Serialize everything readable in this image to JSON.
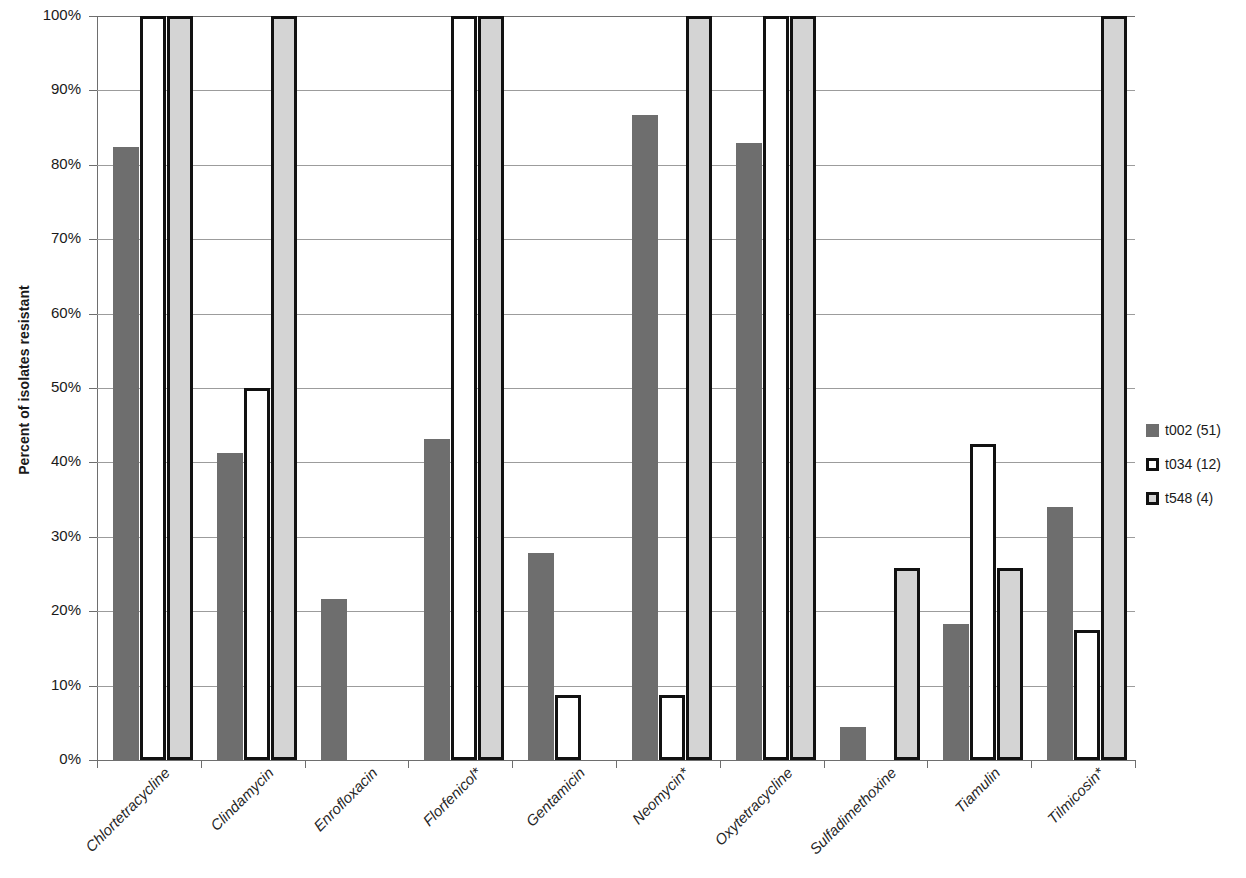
{
  "chart_data": {
    "type": "bar",
    "title": "",
    "subtitle": "",
    "xlabel": "",
    "ylabel": "Percent of isolates resistant",
    "ylim": [
      0,
      100
    ],
    "ytick_labels": [
      "100%",
      "90%",
      "80%",
      "70%",
      "60%",
      "50%",
      "40%",
      "30%",
      "20%",
      "10%",
      "0%"
    ],
    "ytick_values": [
      100,
      90,
      80,
      70,
      60,
      50,
      40,
      30,
      20,
      10,
      0
    ],
    "grid": true,
    "legend_position": "right",
    "categories": [
      "Chlortetracycline",
      "Clindamycin",
      "Enrofloxacin",
      "Florfenicol*",
      "Gentamicin",
      "Neomycin*",
      "Oxytetracycline",
      "Sulfadimethoxine",
      "Tiamulin",
      "Tilmicosin*"
    ],
    "series": [
      {
        "name": "t002 (51)",
        "color": "#6e6e6e",
        "style": "filled-dark",
        "values": [
          82.4,
          41.2,
          21.6,
          43.1,
          27.8,
          86.7,
          82.9,
          4.4,
          18.3,
          34.0
        ]
      },
      {
        "name": "t034 (12)",
        "color": "#ffffff",
        "style": "white-outlined",
        "values": [
          100,
          50.0,
          0,
          100,
          8.8,
          8.8,
          100,
          0,
          42.5,
          17.5
        ]
      },
      {
        "name": "t548 (4)",
        "color": "#d4d4d4",
        "style": "light-outlined",
        "values": [
          100,
          100,
          0,
          100,
          0,
          100,
          100,
          25.8,
          25.8,
          100
        ]
      }
    ]
  },
  "legend": {
    "items": [
      {
        "label": "t002 (51)"
      },
      {
        "label": "t034 (12)"
      },
      {
        "label": "t548 (4)"
      }
    ]
  }
}
